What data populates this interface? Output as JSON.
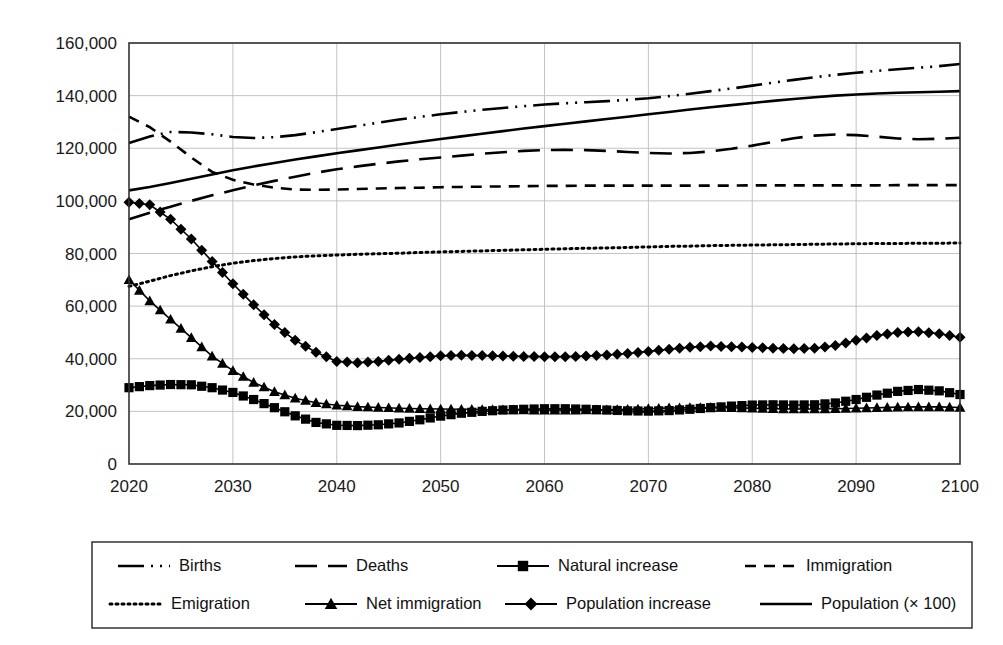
{
  "chart_data": {
    "type": "line",
    "title": "",
    "subtitle": "",
    "xlabel": "",
    "ylabel": "",
    "xlim": [
      2020,
      2100
    ],
    "ylim": [
      0,
      160000
    ],
    "grid": true,
    "legend_position": "bottom",
    "x_ticks": [
      "2020",
      "2030",
      "2040",
      "2050",
      "2060",
      "2070",
      "2080",
      "2090",
      "2100"
    ],
    "x_tick_values": [
      2020,
      2030,
      2040,
      2050,
      2060,
      2070,
      2080,
      2090,
      2100
    ],
    "y_ticks": [
      "0",
      "20,000",
      "40,000",
      "60,000",
      "80,000",
      "100,000",
      "120,000",
      "140,000",
      "160,000"
    ],
    "y_tick_values": [
      0,
      20000,
      40000,
      60000,
      80000,
      100000,
      120000,
      140000,
      160000
    ],
    "x": [
      2020,
      2022,
      2024,
      2026,
      2028,
      2030,
      2032,
      2034,
      2036,
      2038,
      2040,
      2042,
      2044,
      2046,
      2048,
      2050,
      2052,
      2054,
      2056,
      2058,
      2060,
      2062,
      2064,
      2066,
      2068,
      2070,
      2072,
      2074,
      2076,
      2078,
      2080,
      2082,
      2084,
      2086,
      2088,
      2090,
      2092,
      2094,
      2096,
      2098,
      2100
    ],
    "series": [
      {
        "name": "Births",
        "marker": "none",
        "dash": "dash-dot-dot",
        "values": [
          122000,
          124500,
          126200,
          126000,
          125300,
          124300,
          123900,
          124200,
          125000,
          126100,
          127300,
          128500,
          129700,
          130900,
          131900,
          132900,
          133800,
          134600,
          135300,
          136000,
          136600,
          137100,
          137500,
          137900,
          138400,
          139000,
          139800,
          140700,
          141700,
          142700,
          143800,
          144900,
          146000,
          147000,
          147900,
          148700,
          149400,
          150000,
          150600,
          151200,
          152000
        ]
      },
      {
        "name": "Deaths",
        "marker": "none",
        "dash": "long-dash",
        "values": [
          93000,
          95500,
          97800,
          100000,
          102100,
          104000,
          105900,
          107600,
          109200,
          110700,
          112000,
          113100,
          114100,
          115000,
          115800,
          116500,
          117200,
          117900,
          118500,
          119000,
          119300,
          119400,
          119300,
          119000,
          118600,
          118200,
          118000,
          118200,
          118800,
          119800,
          121000,
          122400,
          123800,
          124800,
          125200,
          125000,
          124400,
          123700,
          123400,
          123600,
          124000
        ]
      },
      {
        "name": "Natural increase",
        "marker": "square",
        "dash": "solid",
        "values": [
          29000,
          29800,
          30200,
          30100,
          29000,
          27200,
          24500,
          21400,
          18300,
          15800,
          14700,
          14600,
          14900,
          15600,
          16800,
          18200,
          19300,
          20000,
          20500,
          20800,
          21000,
          21000,
          20800,
          20500,
          20200,
          20100,
          20300,
          20800,
          21400,
          22000,
          22400,
          22500,
          22400,
          22500,
          23200,
          24500,
          26200,
          27600,
          28300,
          27800,
          26400
        ]
      },
      {
        "name": "Immigration",
        "marker": "none",
        "dash": "short-dash",
        "values": [
          132000,
          128000,
          122500,
          116500,
          111000,
          108000,
          106200,
          105000,
          104300,
          104200,
          104300,
          104500,
          104700,
          104900,
          105000,
          105200,
          105300,
          105400,
          105500,
          105600,
          105700,
          105700,
          105800,
          105800,
          105800,
          105800,
          105800,
          105800,
          105800,
          105800,
          105900,
          105900,
          105900,
          105900,
          105900,
          105900,
          105900,
          106000,
          106000,
          106000,
          106000
        ]
      },
      {
        "name": "Emigration",
        "marker": "none",
        "dash": "dotted",
        "values": [
          67500,
          69500,
          71600,
          73400,
          75000,
          76300,
          77300,
          78100,
          78700,
          79100,
          79400,
          79700,
          79900,
          80100,
          80400,
          80600,
          80800,
          81000,
          81200,
          81400,
          81600,
          81800,
          82000,
          82100,
          82300,
          82500,
          82700,
          82800,
          83000,
          83100,
          83200,
          83300,
          83400,
          83500,
          83600,
          83700,
          83800,
          83800,
          83900,
          83900,
          84000
        ]
      },
      {
        "name": "Net immigration",
        "marker": "triangle",
        "dash": "solid",
        "values": [
          70000,
          62000,
          55000,
          48000,
          41000,
          35500,
          31000,
          27500,
          25000,
          23300,
          22300,
          21800,
          21500,
          21200,
          21000,
          20900,
          20800,
          20700,
          20600,
          20500,
          20400,
          20400,
          20500,
          20600,
          20800,
          21000,
          21300,
          21400,
          21500,
          21400,
          21200,
          21000,
          20900,
          20900,
          21000,
          21200,
          21400,
          21600,
          21700,
          21700,
          21500
        ]
      },
      {
        "name": "Population increase",
        "marker": "diamond",
        "dash": "solid",
        "values": [
          99500,
          98500,
          93000,
          85500,
          77000,
          68500,
          60500,
          53000,
          47000,
          42500,
          39000,
          38500,
          39000,
          39800,
          40500,
          41100,
          41300,
          41200,
          41000,
          40900,
          40800,
          40800,
          41000,
          41400,
          42000,
          42800,
          43600,
          44400,
          44800,
          44600,
          44300,
          44000,
          43800,
          44000,
          45000,
          47000,
          48800,
          50000,
          50300,
          49500,
          48200
        ]
      },
      {
        "name": "Population (× 100)",
        "marker": "none",
        "dash": "solid",
        "values": [
          104000,
          105300,
          106800,
          108400,
          110000,
          111600,
          113100,
          114400,
          115700,
          116900,
          118100,
          119200,
          120300,
          121400,
          122500,
          123500,
          124500,
          125500,
          126500,
          127500,
          128400,
          129300,
          130200,
          131100,
          132000,
          132900,
          133800,
          134700,
          135600,
          136400,
          137200,
          138000,
          138700,
          139400,
          140000,
          140400,
          140800,
          141100,
          141300,
          141500,
          141700
        ]
      }
    ],
    "legend": [
      {
        "label": "Births",
        "marker": "none",
        "dash": "dash-dot-dot"
      },
      {
        "label": "Deaths",
        "marker": "none",
        "dash": "long-dash"
      },
      {
        "label": "Natural increase",
        "marker": "square",
        "dash": "solid"
      },
      {
        "label": "Immigration",
        "marker": "none",
        "dash": "short-dash"
      },
      {
        "label": "Emigration",
        "marker": "none",
        "dash": "dotted"
      },
      {
        "label": "Net immigration",
        "marker": "triangle",
        "dash": "solid"
      },
      {
        "label": "Population increase",
        "marker": "diamond",
        "dash": "solid"
      },
      {
        "label": "Population (× 100)",
        "marker": "none",
        "dash": "solid"
      }
    ],
    "colors": {
      "line": "#000000",
      "grid": "#bdbdbd",
      "axis": "#333333",
      "text": "#1a1a1a",
      "background": "#ffffff"
    }
  }
}
